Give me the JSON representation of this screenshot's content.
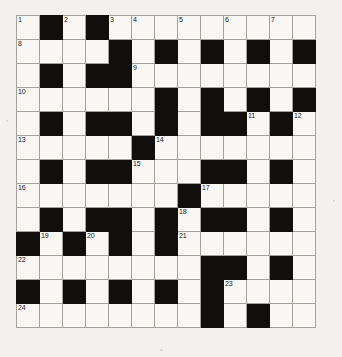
{
  "puzzle": {
    "title": "Crossword grid",
    "columns": 13,
    "rows": 13,
    "colors": {
      "page_background": "#f2f1ef",
      "cell_background": "#f8f7f4",
      "block_background": "#100f0d",
      "grid_line": "#a3a29d",
      "outer_border": "#7e7d79",
      "number_text": "#1a1a1a"
    },
    "legend": {
      "white_cell": "fillable letter square",
      "black_cell": "blocked square"
    },
    "grid": [
      [
        "W1",
        "B",
        "W2",
        "B",
        "W3",
        "W4",
        "W",
        "W5",
        "W",
        "W6",
        "W",
        "W7",
        "W"
      ],
      [
        "W8",
        "W",
        "W",
        "W",
        "B",
        "W",
        "B",
        "W",
        "B",
        "W",
        "B",
        "W",
        "B"
      ],
      [
        "W",
        "B",
        "W",
        "B",
        "B",
        "W9",
        "W",
        "W",
        "W",
        "W",
        "W",
        "W",
        "W"
      ],
      [
        "W10",
        "W",
        "W",
        "W",
        "W",
        "W",
        "B",
        "W",
        "B",
        "W",
        "B",
        "W",
        "B"
      ],
      [
        "W",
        "B",
        "W",
        "B",
        "B",
        "W",
        "B",
        "W",
        "B",
        "B",
        "W11",
        "B",
        "W12"
      ],
      [
        "W13",
        "W",
        "W",
        "W",
        "W",
        "B",
        "W14",
        "W",
        "W",
        "W",
        "W",
        "W",
        "W"
      ],
      [
        "W",
        "B",
        "W",
        "B",
        "B",
        "W15",
        "W",
        "W",
        "B",
        "B",
        "W",
        "B",
        "W"
      ],
      [
        "W16",
        "W",
        "W",
        "W",
        "W",
        "W",
        "W",
        "B",
        "W17",
        "W",
        "W",
        "W",
        "W"
      ],
      [
        "W",
        "B",
        "W",
        "B",
        "B",
        "W",
        "B",
        "W18",
        "B",
        "B",
        "W",
        "B",
        "W"
      ],
      [
        "B",
        "W19",
        "B",
        "W20",
        "B",
        "W",
        "B",
        "W21",
        "W",
        "W",
        "W",
        "W",
        "W"
      ],
      [
        "W22",
        "W",
        "W",
        "W",
        "W",
        "W",
        "W",
        "W",
        "B",
        "B",
        "W",
        "B",
        "W"
      ],
      [
        "B",
        "W",
        "B",
        "W",
        "B",
        "W",
        "B",
        "W",
        "B",
        "W23",
        "W",
        "W",
        "W"
      ],
      [
        "W24",
        "W",
        "W",
        "W",
        "W",
        "W",
        "W",
        "W",
        "B",
        "W",
        "B",
        "W",
        "W"
      ]
    ],
    "numbers": [
      1,
      2,
      3,
      4,
      5,
      6,
      7,
      8,
      9,
      10,
      11,
      12,
      13,
      14,
      15,
      16,
      17,
      18,
      19,
      20,
      21,
      22,
      23,
      24
    ],
    "entries_count": 24
  }
}
